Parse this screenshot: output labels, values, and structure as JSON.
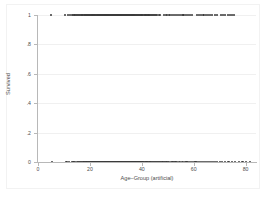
{
  "chart_data": {
    "type": "scatter",
    "title": "",
    "xlabel": "Age–Group (artificial)",
    "ylabel": "Survived",
    "xlim": [
      0,
      84
    ],
    "ylim": [
      0,
      1
    ],
    "xticks": [
      0,
      20,
      40,
      60,
      80
    ],
    "xticklabels": [
      "0",
      "20",
      "40",
      "60",
      "80"
    ],
    "yticks": [
      0,
      0.2,
      0.4,
      0.6,
      0.8,
      1
    ],
    "yticklabels": [
      "0",
      ".2",
      ".4",
      ".6",
      ".8",
      "1"
    ],
    "grid": "horizontal",
    "legend": "none",
    "marker": {
      "shape": "circle",
      "color": "#3b3b3b",
      "size": 2.2
    },
    "series": [
      {
        "name": "Survived = 1",
        "y": 1,
        "x": [
          5.1,
          10.4,
          11.6,
          12.2,
          13.0,
          13.6,
          14.1,
          14.6,
          15.0,
          15.4,
          15.8,
          16.1,
          16.5,
          16.8,
          17.1,
          17.4,
          17.7,
          18.0,
          18.2,
          18.5,
          18.8,
          19.0,
          19.3,
          19.5,
          19.8,
          20.0,
          20.3,
          20.5,
          20.8,
          21.0,
          21.2,
          21.5,
          21.7,
          21.9,
          22.1,
          22.3,
          22.6,
          22.8,
          23.0,
          23.2,
          23.4,
          23.6,
          23.8,
          24.0,
          24.2,
          24.4,
          24.6,
          24.8,
          25.0,
          25.2,
          25.4,
          25.6,
          25.8,
          26.0,
          26.2,
          26.4,
          26.6,
          26.8,
          27.0,
          27.2,
          27.4,
          27.6,
          27.8,
          28.0,
          28.2,
          28.4,
          28.6,
          28.8,
          29.0,
          29.2,
          29.4,
          29.6,
          29.8,
          30.0,
          30.2,
          30.4,
          30.6,
          30.8,
          31.0,
          31.2,
          31.4,
          31.6,
          31.8,
          32.0,
          32.2,
          32.4,
          32.6,
          32.8,
          33.0,
          33.2,
          33.4,
          33.6,
          33.8,
          34.0,
          34.2,
          34.4,
          34.6,
          34.8,
          35.0,
          35.2,
          35.4,
          35.6,
          35.8,
          36.0,
          36.2,
          36.4,
          36.6,
          36.8,
          37.0,
          37.3,
          37.5,
          37.8,
          38.0,
          38.3,
          38.5,
          38.8,
          39.0,
          39.3,
          39.6,
          39.9,
          40.2,
          40.5,
          40.8,
          41.1,
          41.4,
          41.7,
          42.0,
          42.3,
          42.6,
          42.9,
          43.2,
          43.6,
          44.0,
          44.4,
          44.8,
          45.2,
          45.6,
          46.0,
          46.5,
          47.0,
          48.6,
          49.2,
          49.8,
          50.4,
          51.0,
          51.7,
          52.4,
          53.1,
          53.9,
          54.6,
          55.4,
          56.1,
          56.9,
          57.8,
          58.6,
          59.4,
          61.2,
          62.0,
          62.9,
          63.8,
          64.6,
          65.5,
          66.4,
          67.2,
          68.1,
          69.0,
          70.4,
          71.3,
          72.2,
          73.1,
          74.0,
          74.8,
          75.6
        ]
      },
      {
        "name": "Survived = 0",
        "y": 0,
        "x": [
          5.4,
          11.0,
          12.1,
          13.0,
          13.7,
          14.3,
          14.9,
          15.4,
          15.9,
          16.3,
          16.7,
          17.1,
          17.5,
          17.8,
          18.1,
          18.4,
          18.7,
          19.0,
          19.3,
          19.5,
          19.8,
          20.0,
          20.3,
          20.5,
          20.7,
          21.0,
          21.2,
          21.4,
          21.6,
          21.8,
          22.0,
          22.2,
          22.4,
          22.6,
          22.8,
          23.0,
          23.2,
          23.4,
          23.6,
          23.8,
          24.0,
          24.2,
          24.4,
          24.6,
          24.8,
          25.0,
          25.2,
          25.4,
          25.6,
          25.8,
          26.0,
          26.2,
          26.4,
          26.6,
          26.8,
          27.0,
          27.2,
          27.4,
          27.6,
          27.8,
          28.0,
          28.2,
          28.4,
          28.6,
          28.8,
          29.0,
          29.2,
          29.4,
          29.6,
          29.8,
          30.0,
          30.2,
          30.4,
          30.6,
          30.8,
          31.0,
          31.2,
          31.4,
          31.6,
          31.8,
          32.0,
          32.2,
          32.4,
          32.6,
          32.8,
          33.0,
          33.2,
          33.4,
          33.6,
          33.8,
          34.0,
          34.2,
          34.4,
          34.6,
          34.8,
          35.0,
          35.2,
          35.4,
          35.6,
          35.8,
          36.0,
          36.2,
          36.4,
          36.6,
          36.8,
          37.0,
          37.2,
          37.4,
          37.6,
          37.8,
          38.0,
          38.2,
          38.4,
          38.6,
          38.8,
          39.0,
          39.2,
          39.4,
          39.6,
          39.8,
          40.0,
          40.3,
          40.6,
          40.9,
          41.2,
          41.5,
          41.8,
          42.1,
          42.4,
          42.7,
          43.0,
          43.3,
          43.6,
          43.9,
          44.2,
          44.6,
          45.0,
          45.4,
          45.8,
          46.2,
          46.6,
          47.0,
          47.5,
          48.0,
          48.5,
          49.0,
          49.5,
          50.0,
          50.6,
          51.2,
          51.8,
          52.4,
          53.0,
          53.6,
          54.2,
          54.8,
          55.4,
          56.0,
          56.6,
          57.2,
          57.9,
          58.6,
          59.3,
          60.0,
          60.7,
          61.4,
          62.1,
          62.8,
          63.5,
          64.2,
          65.0,
          65.8,
          66.6,
          67.4,
          68.2,
          69.0,
          70.0,
          71.0,
          72.2,
          73.4,
          74.6,
          76.0,
          77.4,
          78.8,
          80.2,
          81.6
        ]
      }
    ]
  }
}
